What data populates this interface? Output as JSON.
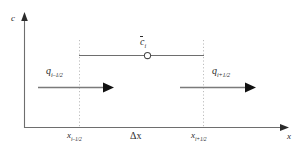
{
  "figure": {
    "kind": "finite-volume-control-cell-diagram",
    "background_color": "#ffffff",
    "line_color": "#6e6e6e",
    "text_color": "#2b2b2b",
    "dotted_color": "#b8b8b8"
  },
  "axes": {
    "vertical": {
      "label": "c",
      "name": "concentration-axis"
    },
    "horizontal": {
      "label": "x",
      "name": "position-axis"
    }
  },
  "cell": {
    "average_symbol": "c",
    "average_subscript": "i",
    "width_label": "Δx",
    "left_boundary_symbol": "x",
    "left_boundary_subscript": "i–1/2",
    "right_boundary_symbol": "x",
    "right_boundary_subscript": "i+1/2"
  },
  "fluxes": [
    {
      "name": "flux-left",
      "symbol": "q",
      "subscript": "i–1/2",
      "direction": "right"
    },
    {
      "name": "flux-right",
      "symbol": "q",
      "subscript": "i+1/2",
      "direction": "right"
    }
  ]
}
